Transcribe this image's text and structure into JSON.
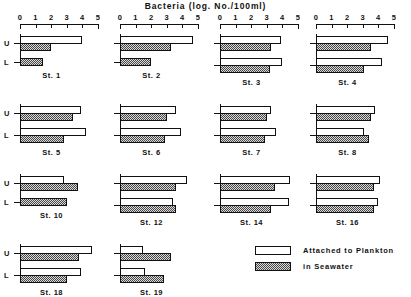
{
  "chart_data": {
    "type": "bar",
    "title": "Bacteria  (log. No./100ml)",
    "xlabel": "",
    "ylabel": "",
    "xlim": [
      0,
      5
    ],
    "xticks": [
      0,
      1,
      2,
      3,
      4,
      5
    ],
    "xtick_labels": [
      "0",
      "1",
      "2",
      "3",
      "4",
      "5"
    ],
    "grid": false,
    "orientation": "horizontal",
    "legend_position": "bottom-right",
    "depth_labels": {
      "upper": "U",
      "lower": "L"
    },
    "legend": [
      {
        "name": "Attached to Plankton",
        "fill": "white",
        "color": "#ffffff"
      },
      {
        "name": "in Seawater",
        "fill": "hatched",
        "color": "#8f8f8f"
      }
    ],
    "series": [
      {
        "name": "Attached to Plankton"
      },
      {
        "name": "in Seawater"
      }
    ],
    "panels": [
      {
        "station": "St. 1",
        "bars": [
          {
            "depth": "U",
            "series": "Attached to Plankton",
            "value": 4.0
          },
          {
            "depth": "U",
            "series": "in Seawater",
            "value": 2.0
          },
          {
            "depth": "L",
            "series": "in Seawater",
            "value": 1.5
          }
        ]
      },
      {
        "station": "St. 2",
        "bars": [
          {
            "depth": "U",
            "series": "Attached to Plankton",
            "value": 4.7
          },
          {
            "depth": "U",
            "series": "in Seawater",
            "value": 3.3
          },
          {
            "depth": "L",
            "series": "in Seawater",
            "value": 2.0
          }
        ]
      },
      {
        "station": "St. 3",
        "bars": [
          {
            "depth": "U",
            "series": "Attached to Plankton",
            "value": 3.9
          },
          {
            "depth": "U",
            "series": "in Seawater",
            "value": 3.3
          },
          {
            "depth": "L",
            "series": "Attached to Plankton",
            "value": 4.0
          },
          {
            "depth": "L",
            "series": "in Seawater",
            "value": 3.2
          }
        ]
      },
      {
        "station": "St. 4",
        "bars": [
          {
            "depth": "U",
            "series": "Attached to Plankton",
            "value": 4.6
          },
          {
            "depth": "U",
            "series": "in Seawater",
            "value": 3.5
          },
          {
            "depth": "L",
            "series": "Attached to Plankton",
            "value": 4.2
          },
          {
            "depth": "L",
            "series": "in Seawater",
            "value": 3.1
          }
        ]
      },
      {
        "station": "St. 5",
        "bars": [
          {
            "depth": "U",
            "series": "Attached to Plankton",
            "value": 3.9
          },
          {
            "depth": "U",
            "series": "in Seawater",
            "value": 3.4
          },
          {
            "depth": "L",
            "series": "Attached to Plankton",
            "value": 4.2
          },
          {
            "depth": "L",
            "series": "in Seawater",
            "value": 2.8
          }
        ]
      },
      {
        "station": "St. 6",
        "bars": [
          {
            "depth": "U",
            "series": "Attached to Plankton",
            "value": 3.6
          },
          {
            "depth": "U",
            "series": "in Seawater",
            "value": 3.0
          },
          {
            "depth": "L",
            "series": "Attached to Plankton",
            "value": 3.9
          },
          {
            "depth": "L",
            "series": "in Seawater",
            "value": 2.9
          }
        ]
      },
      {
        "station": "St. 7",
        "bars": [
          {
            "depth": "U",
            "series": "Attached to Plankton",
            "value": 3.3
          },
          {
            "depth": "U",
            "series": "in Seawater",
            "value": 3.0
          },
          {
            "depth": "L",
            "series": "Attached to Plankton",
            "value": 3.6
          },
          {
            "depth": "L",
            "series": "in Seawater",
            "value": 2.9
          }
        ]
      },
      {
        "station": "St. 8",
        "bars": [
          {
            "depth": "U",
            "series": "Attached to Plankton",
            "value": 3.8
          },
          {
            "depth": "U",
            "series": "in Seawater",
            "value": 3.5
          },
          {
            "depth": "L",
            "series": "Attached to Plankton",
            "value": 3.1
          },
          {
            "depth": "L",
            "series": "in Seawater",
            "value": 3.4
          }
        ]
      },
      {
        "station": "St. 10",
        "bars": [
          {
            "depth": "U",
            "series": "Attached to Plankton",
            "value": 2.8
          },
          {
            "depth": "U",
            "series": "in Seawater",
            "value": 3.7
          },
          {
            "depth": "L",
            "series": "in Seawater",
            "value": 3.0
          }
        ]
      },
      {
        "station": "St. 12",
        "bars": [
          {
            "depth": "U",
            "series": "Attached to Plankton",
            "value": 4.3
          },
          {
            "depth": "U",
            "series": "in Seawater",
            "value": 3.6
          },
          {
            "depth": "L",
            "series": "Attached to Plankton",
            "value": 3.4
          },
          {
            "depth": "L",
            "series": "in Seawater",
            "value": 3.6
          }
        ]
      },
      {
        "station": "St. 14",
        "bars": [
          {
            "depth": "U",
            "series": "Attached to Plankton",
            "value": 4.5
          },
          {
            "depth": "U",
            "series": "in Seawater",
            "value": 3.5
          },
          {
            "depth": "L",
            "series": "Attached to Plankton",
            "value": 4.4
          },
          {
            "depth": "L",
            "series": "in Seawater",
            "value": 3.3
          }
        ]
      },
      {
        "station": "St. 16",
        "bars": [
          {
            "depth": "U",
            "series": "Attached to Plankton",
            "value": 4.1
          },
          {
            "depth": "U",
            "series": "in Seawater",
            "value": 3.7
          },
          {
            "depth": "L",
            "series": "Attached to Plankton",
            "value": 4.0
          },
          {
            "depth": "L",
            "series": "in Seawater",
            "value": 3.7
          }
        ]
      },
      {
        "station": "St. 18",
        "bars": [
          {
            "depth": "U",
            "series": "Attached to Plankton",
            "value": 4.6
          },
          {
            "depth": "U",
            "series": "in Seawater",
            "value": 3.8
          },
          {
            "depth": "L",
            "series": "Attached to Plankton",
            "value": 3.9
          },
          {
            "depth": "L",
            "series": "in Seawater",
            "value": 3.0
          }
        ]
      },
      {
        "station": "St. 19",
        "bars": [
          {
            "depth": "U",
            "series": "Attached to Plankton",
            "value": 1.5
          },
          {
            "depth": "U",
            "series": "in Seawater",
            "value": 3.3
          },
          {
            "depth": "L",
            "series": "Attached to Plankton",
            "value": 1.6
          },
          {
            "depth": "L",
            "series": "in Seawater",
            "value": 2.8
          }
        ]
      }
    ]
  }
}
